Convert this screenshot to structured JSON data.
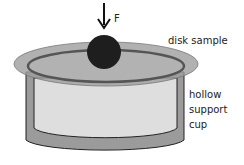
{
  "diagram": {
    "force_label": "F",
    "disk_label": "disk sample",
    "cup_label_lines": [
      "hollow",
      "support",
      "cup"
    ],
    "colors": {
      "background": "#ffffff",
      "disk_fill": "#a9a9a9",
      "cup_fill": "#9a9a9a",
      "cup_inner_fill": "#dcdcdc",
      "ball_fill": "#1e1e1e",
      "outline": "#222222"
    }
  }
}
